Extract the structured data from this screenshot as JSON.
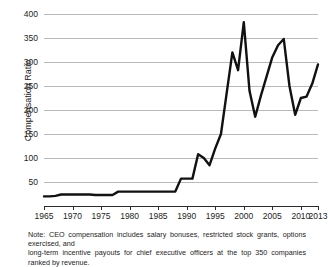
{
  "chart_data": {
    "type": "line",
    "title": "",
    "subtitle": "",
    "xlabel": "",
    "ylabel": "Compensation Ratio",
    "xlim": [
      1965,
      2013
    ],
    "ylim": [
      0,
      400
    ],
    "grid": true,
    "legend": null,
    "y_ticks": [
      50,
      100,
      150,
      200,
      250,
      300,
      350,
      400
    ],
    "y_tick_labels": [
      "50",
      "100",
      "150",
      "200",
      "250",
      "300",
      "350",
      "400"
    ],
    "x_ticks": [
      1965,
      1970,
      1975,
      1980,
      1985,
      1990,
      1995,
      2000,
      2005,
      2010,
      2013
    ],
    "x_tick_labels": [
      "1965",
      "1970",
      "1975",
      "1980",
      "1985",
      "1990",
      "1995",
      "2000",
      "2005",
      "2010",
      "2013"
    ],
    "line_color": "#111111",
    "line_width": 2.4,
    "x": [
      1965,
      1966,
      1967,
      1968,
      1969,
      1970,
      1971,
      1972,
      1973,
      1974,
      1975,
      1976,
      1977,
      1978,
      1979,
      1980,
      1981,
      1982,
      1983,
      1984,
      1985,
      1986,
      1987,
      1988,
      1989,
      1990,
      1991,
      1992,
      1993,
      1994,
      1995,
      1996,
      1997,
      1998,
      1999,
      2000,
      2001,
      2002,
      2003,
      2004,
      2005,
      2006,
      2007,
      2008,
      2009,
      2010,
      2011,
      2012,
      2013
    ],
    "values": [
      20,
      20,
      21,
      24,
      24,
      24,
      24,
      24,
      24,
      23,
      23,
      23,
      23,
      30,
      30,
      30,
      30,
      30,
      30,
      30,
      30,
      30,
      30,
      30,
      57,
      57,
      57,
      108,
      100,
      85,
      120,
      150,
      235,
      320,
      283,
      383,
      240,
      186,
      230,
      270,
      310,
      335,
      348,
      250,
      190,
      225,
      228,
      255,
      295
    ]
  },
  "footnote": {
    "line1": "Note: CEO compensation includes salary bonuses, restricted stock grants, options exercised, and",
    "line2": "long-term incentive payouts for chief executive officers at the top 350 companies ranked by revenue."
  }
}
